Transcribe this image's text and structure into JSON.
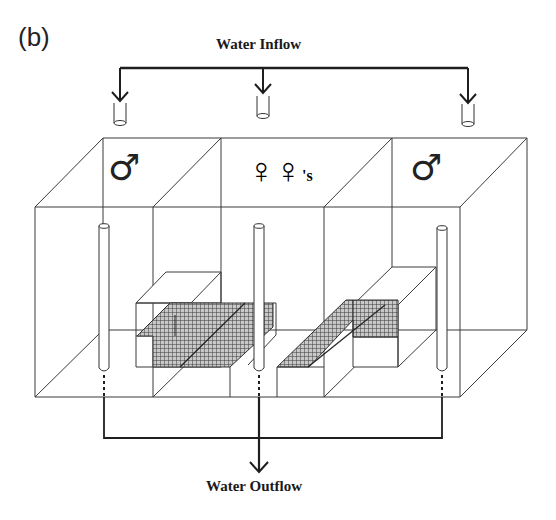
{
  "figure": {
    "panel_label": "(b)",
    "inflow_label": "Water Inflow",
    "outflow_label": "Water Outflow",
    "compartments": [
      {
        "position": "left",
        "symbol": "♂",
        "meaning": "male"
      },
      {
        "position": "center",
        "symbol": "♀♀",
        "suffix": "'s",
        "meaning": "females"
      },
      {
        "position": "right",
        "symbol": "♂",
        "meaning": "male"
      }
    ],
    "colors": {
      "line": "#2a2a2a",
      "mesh": "#555555",
      "background": "#ffffff"
    }
  }
}
